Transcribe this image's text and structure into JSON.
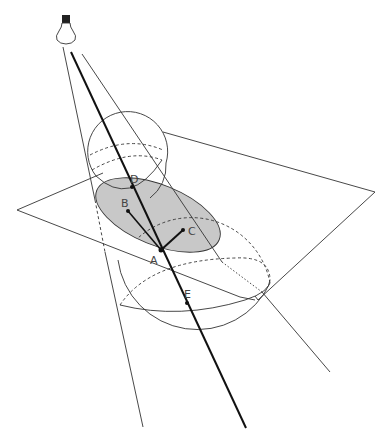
{
  "figure": {
    "labels": {
      "D": "D",
      "B": "B",
      "C": "C",
      "A": "A",
      "E": "E"
    },
    "colors": {
      "stroke": "#333333",
      "shading": "#c8c8c8",
      "background": "#ffffff"
    },
    "icons": {
      "light_source": "light-bulb-icon"
    }
  }
}
